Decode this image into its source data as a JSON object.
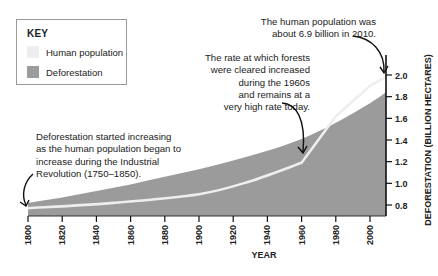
{
  "key": {
    "title": "KEY",
    "items": [
      {
        "label": "Human population",
        "color": "#eeeeee"
      },
      {
        "label": "Deforestation",
        "color": "#9b9b9b"
      }
    ]
  },
  "annotations": {
    "population_2010": [
      "The human population was",
      "about 6.9 billion in 2010."
    ],
    "rate_1960s": [
      "The rate at which forests",
      "were cleared increased",
      "during the 1960s",
      "and remains at a",
      "very high rate today."
    ],
    "industrial_revolution": [
      "Deforestation started increasing",
      "as the human population began to",
      "increase during the Industrial",
      "Revolution (1750–1850)."
    ]
  },
  "chart_data": {
    "type": "area",
    "title": "",
    "xlabel": "YEAR",
    "ylabel": "DEFORESTATION (BILLION HECTARES)",
    "x_ticks": [
      "1800",
      "1820",
      "1840",
      "1860",
      "1880",
      "1900",
      "1920",
      "1940",
      "1960",
      "1980",
      "2000"
    ],
    "y_ticks": [
      "0.8",
      "1.0",
      "1.2",
      "1.4",
      "1.6",
      "1.8",
      "2.0"
    ],
    "xlim": [
      1800,
      2010
    ],
    "ylim": [
      0.7,
      2.0
    ],
    "grid": false,
    "legend_position": "top-left",
    "series": [
      {
        "name": "Deforestation",
        "type": "area",
        "color": "#9b9b9b",
        "x": [
          1800,
          1820,
          1840,
          1860,
          1880,
          1900,
          1920,
          1940,
          1960,
          1980,
          2000,
          2010
        ],
        "values": [
          0.82,
          0.87,
          0.93,
          0.99,
          1.06,
          1.13,
          1.21,
          1.3,
          1.41,
          1.56,
          1.74,
          1.84
        ]
      },
      {
        "name": "Human population",
        "type": "line",
        "color": "#eeeeee",
        "x": [
          1800,
          1850,
          1900,
          1930,
          1960,
          1980,
          2000,
          2010
        ],
        "values": [
          0.77,
          0.82,
          0.9,
          1.02,
          1.19,
          1.62,
          1.9,
          1.99
        ]
      }
    ]
  }
}
